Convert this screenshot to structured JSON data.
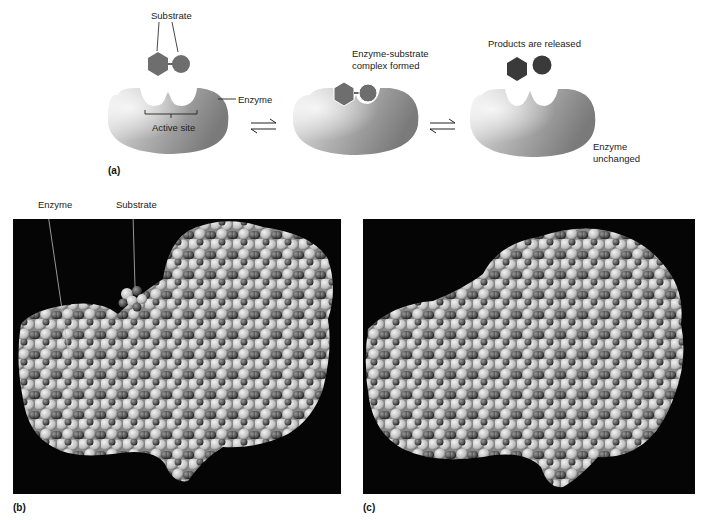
{
  "figure": {
    "panel_a": {
      "letter": "(a)",
      "substrate_label": "Substrate",
      "enzyme_label": "Enzyme",
      "active_site_label": "Active site",
      "complex_label_line1": "Enzyme-substrate",
      "complex_label_line2": "complex formed",
      "products_label": "Products are released",
      "unchanged_label_line1": "Enzyme",
      "unchanged_label_line2": "unchanged",
      "arrow_symbol": "⇌"
    },
    "panel_b": {
      "letter": "(b)",
      "enzyme_label": "Enzyme",
      "substrate_label": "Substrate"
    },
    "panel_c": {
      "letter": "(c)"
    },
    "colors": {
      "enzyme_light": "#e8e8e8",
      "enzyme_dark": "#7a7a7a",
      "substrate": "#6e6e6e",
      "product": "#3a3a3a",
      "photo_bg": "#050505"
    }
  }
}
